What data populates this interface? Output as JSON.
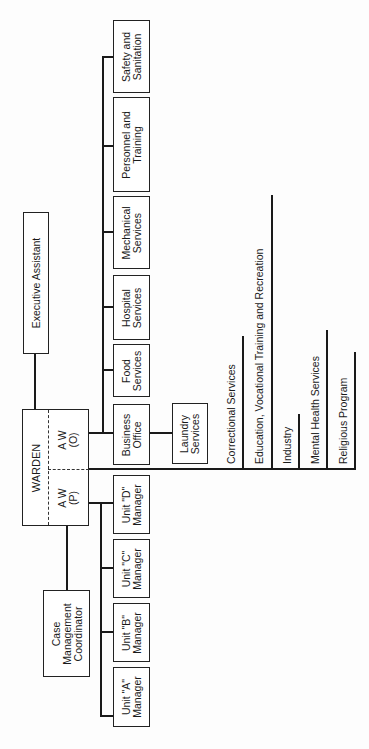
{
  "chart": {
    "top": {
      "label": "WARDEN"
    },
    "deputies": [
      {
        "id": "aw-o",
        "label": "A W\n(O)"
      },
      {
        "id": "aw-p",
        "label": "A W\n(P)"
      }
    ],
    "executive_assistant": {
      "label": "Executive Assistant"
    },
    "case_management": {
      "label": "Case\nManagement\nCoordinator"
    },
    "operations_units": [
      {
        "label": "Business\nOffice"
      },
      {
        "label": "Food\nServices"
      },
      {
        "label": "Hospital\nServices"
      },
      {
        "label": "Mechanical\nServices"
      },
      {
        "label": "Personnel and\nTraining"
      },
      {
        "label": "Safety and\nSanitation"
      }
    ],
    "laundry": {
      "label": "Laundry\nServices"
    },
    "program_units": [
      {
        "label": "Unit \"D\"\nManager"
      },
      {
        "label": "Unit \"C\"\nManager"
      },
      {
        "label": "Unit \"B\"\nManager"
      },
      {
        "label": "Unit \"A\"\nManager"
      }
    ],
    "services": [
      {
        "label": "Correctional Services"
      },
      {
        "label": "Education, Vocational Training and Recreation"
      },
      {
        "label": "Industry"
      },
      {
        "label": "Mental Health Services"
      },
      {
        "label": "Religious Program"
      }
    ]
  }
}
